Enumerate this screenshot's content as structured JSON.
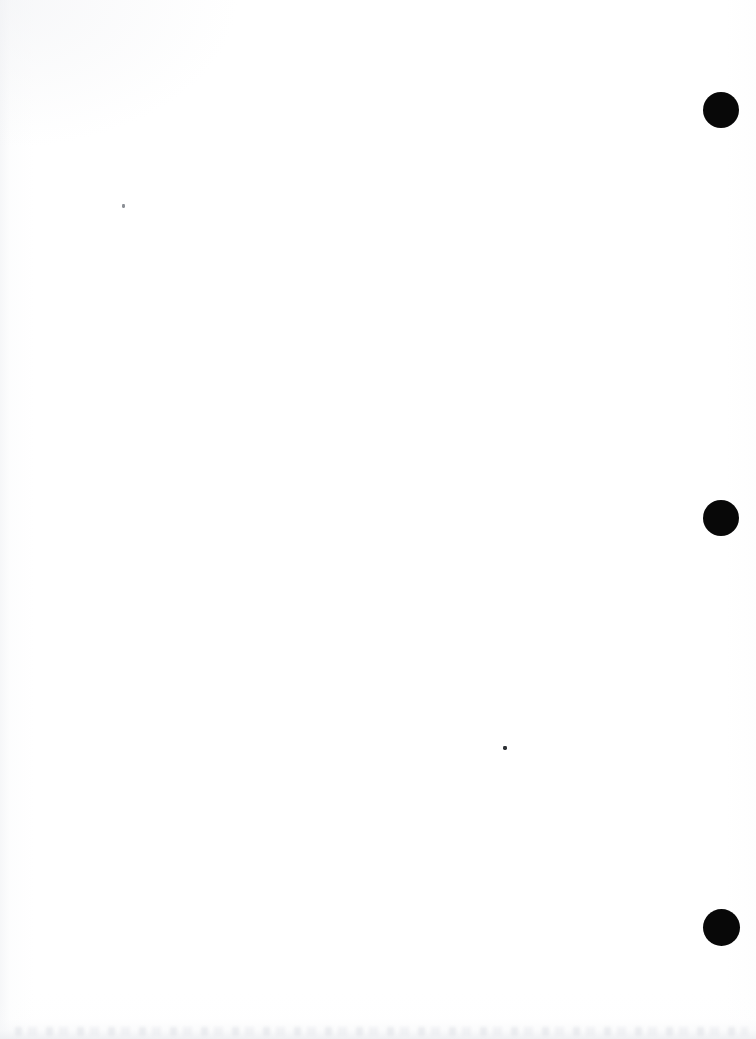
{
  "page": {
    "kind": "scanned-blank-page",
    "width_px": 756,
    "height_px": 1039,
    "orientation": "portrait",
    "background_color": "#ffffff",
    "ink_color": "#080808",
    "visible_text": "",
    "notes_label": ""
  },
  "margin_marks": {
    "label": "",
    "count": 3,
    "color": "#080808",
    "shape": "filled-circle",
    "items": [
      {
        "name": "margin-dot-top",
        "label": "",
        "cx": 721,
        "cy": 110,
        "d": 36
      },
      {
        "name": "margin-dot-middle",
        "label": "",
        "cx": 721,
        "cy": 518,
        "d": 36
      },
      {
        "name": "margin-dot-bottom",
        "label": "",
        "cx": 721,
        "cy": 927,
        "d": 37
      }
    ]
  },
  "specks": {
    "label": "",
    "count": 2,
    "items": [
      {
        "name": "speck-upper-left",
        "label": "",
        "cx": 123,
        "cy": 206,
        "w": 3,
        "h": 4,
        "tone": "light"
      },
      {
        "name": "speck-lower-mid",
        "label": "",
        "cx": 505,
        "cy": 748,
        "w": 4,
        "h": 4,
        "tone": "dark"
      }
    ]
  },
  "artifacts": {
    "bottom_edge_ghosting": "faint",
    "left_edge_gradient": "faint",
    "top_left_haze": "faint"
  }
}
